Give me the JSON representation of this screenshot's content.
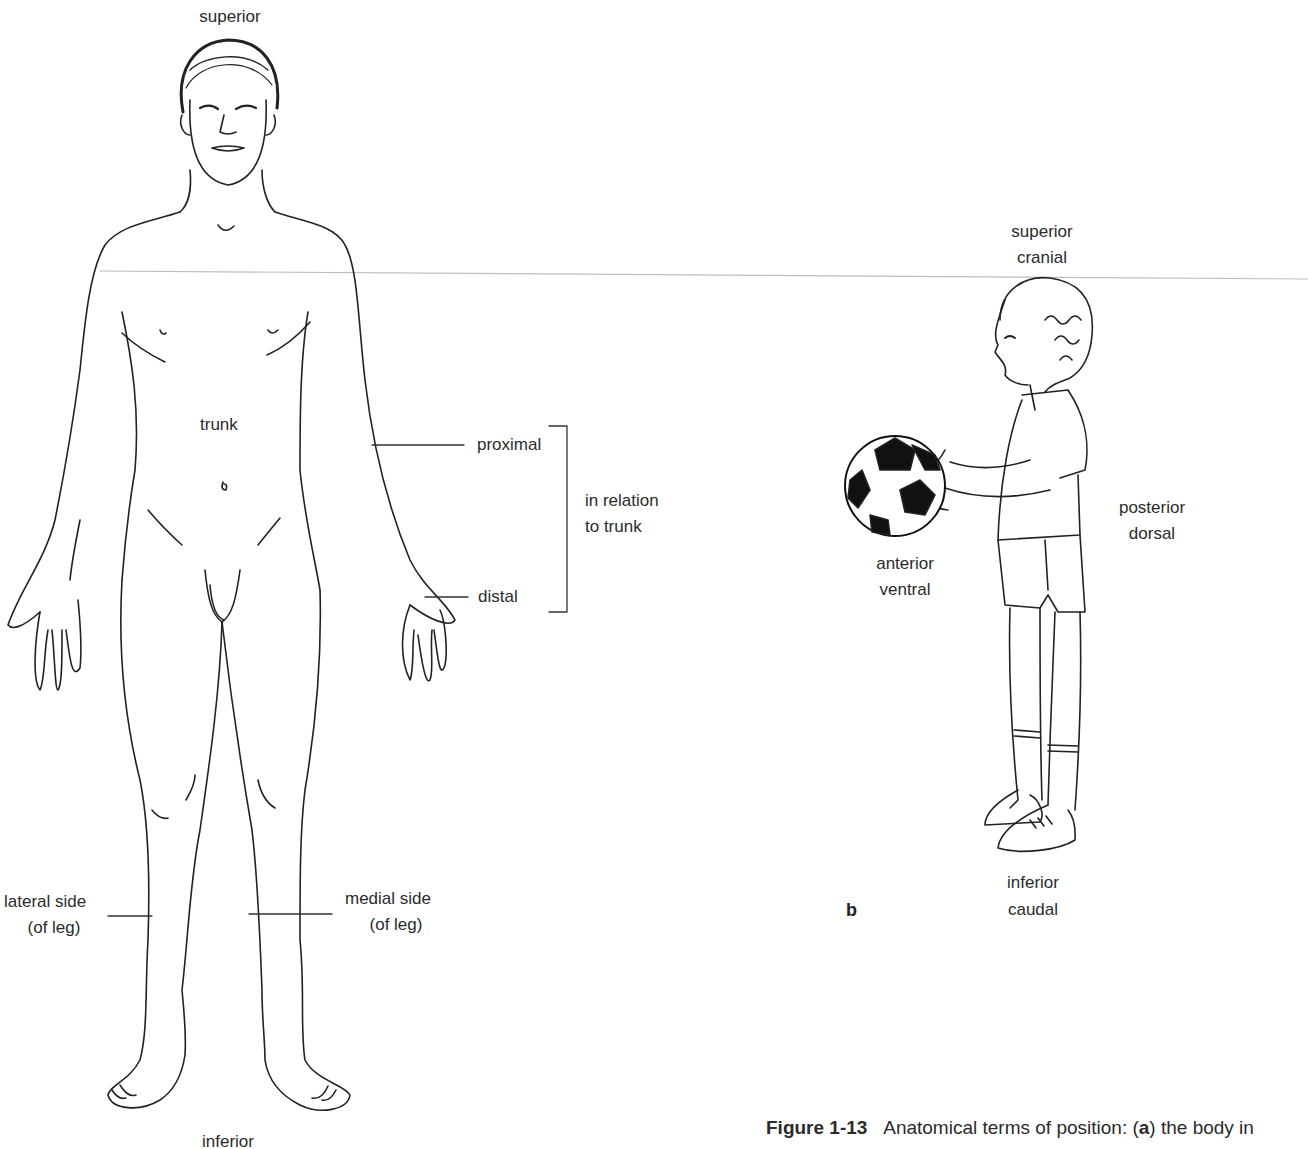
{
  "figure": {
    "number": "Figure 1-13",
    "caption_prefix": "Anatomical terms of position: (",
    "caption_bold_a": "a",
    "caption_suffix": ") the body in"
  },
  "panel_a": {
    "labels": {
      "superior": "superior",
      "inferior": "inferior",
      "trunk": "trunk",
      "proximal": "proximal",
      "distal": "distal",
      "relation_line1": "in relation",
      "relation_line2": "to trunk",
      "lateral_line1": "lateral side",
      "lateral_line2": "(of leg)",
      "medial_line1": "medial side",
      "medial_line2": "(of leg)"
    }
  },
  "panel_b": {
    "letter": "b",
    "labels": {
      "superior": "superior",
      "cranial": "cranial",
      "anterior": "anterior",
      "ventral": "ventral",
      "posterior": "posterior",
      "dorsal": "dorsal",
      "inferior": "inferior",
      "caudal": "caudal"
    }
  },
  "colors": {
    "ink": "#2b2b2b",
    "guide_line": "#b8b8b8",
    "background": "#ffffff"
  }
}
